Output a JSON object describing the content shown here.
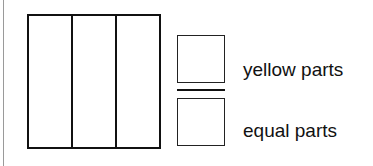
{
  "figure": {
    "rectangle": {
      "parts": 3,
      "shaded_parts": 0
    },
    "fraction": {
      "numerator_box": {
        "value": ""
      },
      "denominator_box": {
        "value": ""
      },
      "numerator_label": "yellow parts",
      "denominator_label": "equal parts"
    }
  },
  "colors": {
    "stroke": "#111111",
    "margin_rule": "#9a9a9a",
    "background": "#ffffff"
  }
}
